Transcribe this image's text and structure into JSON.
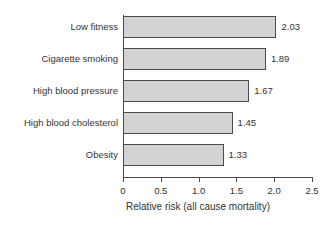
{
  "chart_data": {
    "type": "bar",
    "orientation": "horizontal",
    "title": "",
    "xlabel": "Relative risk (all cause mortality)",
    "ylabel": "",
    "xlim": [
      0,
      2.5
    ],
    "xticks": [
      "0",
      "0.5",
      "1.0",
      "1.5",
      "2.0",
      "2.5"
    ],
    "xtick_values": [
      0,
      0.5,
      1.0,
      1.5,
      2.0,
      2.5
    ],
    "grid": false,
    "legend": "none",
    "categories": [
      "Low fitness",
      "Cigarette smoking",
      "High blood pressure",
      "High blood cholesterol",
      "Obesity"
    ],
    "values": [
      2.03,
      1.89,
      1.67,
      1.45,
      1.33
    ],
    "value_labels": [
      "2.03",
      "1.89",
      "1.67",
      "1.45",
      "1.33"
    ],
    "bar_fill_color": "#d3d3d3",
    "bar_edge_color": "#4a4a4a",
    "axis_color": "#4a4a4a",
    "text_color": "#333333",
    "background_color": "#ffffff"
  }
}
